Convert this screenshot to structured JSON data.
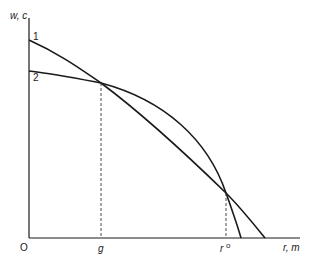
{
  "axes": {
    "y_label": "w, c",
    "x_label": "r, m",
    "origin_label": "O"
  },
  "curves": [
    {
      "label": "1",
      "description": "concave curve from higher w-intercept, crosses x-axis farther out"
    },
    {
      "label": "2",
      "description": "concave curve from lower w-intercept, steeper descent, crosses x-axis first"
    }
  ],
  "markers": {
    "g_label": "g",
    "r0_label": "r",
    "r0_superscript": "o"
  },
  "colors": {
    "ink": "#1a1a1a",
    "background": "#ffffff"
  }
}
